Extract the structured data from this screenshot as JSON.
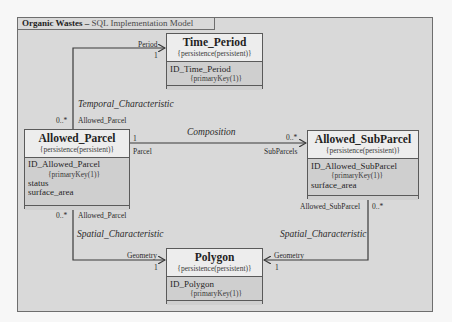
{
  "frame": {
    "title_bold": "Organic Wastes – ",
    "title_rest": "SQL Implementation Model"
  },
  "classes": {
    "time_period": {
      "name": "Time_Period",
      "stereotype": "{persistence(persistent)}",
      "attributes": [
        {
          "name": "ID_Time_Period",
          "constraint": "{primaryKey(1)}"
        }
      ]
    },
    "allowed_parcel": {
      "name": "Allowed_Parcel",
      "stereotype": "{persistence(persistent)}",
      "attributes": [
        {
          "name": "ID_Allowed_Parcel",
          "constraint": "{primaryKey(1)}"
        },
        {
          "name": "status"
        },
        {
          "name": "surface_area"
        }
      ]
    },
    "allowed_subparcel": {
      "name": "Allowed_SubParcel",
      "stereotype": "{persistence(persistent)}",
      "attributes": [
        {
          "name": "ID_Allowed_SubParcel",
          "constraint": "{primaryKey(1)}"
        },
        {
          "name": "surface_area"
        }
      ]
    },
    "polygon": {
      "name": "Polygon",
      "stereotype": "{persistence(persistent)}",
      "attributes": [
        {
          "name": "ID_Polygon",
          "constraint": "{primaryKey(1)}"
        }
      ]
    }
  },
  "associations": {
    "temporal": {
      "name": "Temporal_Characteristic",
      "source_role": "Allowed_Parcel",
      "source_mult": "0..*",
      "target_role": "Period",
      "target_mult": "1"
    },
    "composition": {
      "name": "Composition",
      "source_role": "Parcel",
      "source_mult": "1",
      "target_role": "SubParcels",
      "target_mult": "0..*"
    },
    "spatial_parcel": {
      "name": "Spatial_Characteristic",
      "source_role": "Allowed_Parcel",
      "source_mult": "0..*",
      "target_role": "Geometry",
      "target_mult": "1"
    },
    "spatial_subparcel": {
      "name": "Spatial_Characteristic",
      "source_role": "Allowed_SubParcel",
      "source_mult": "0..*",
      "target_role": "Geometry",
      "target_mult": "1"
    }
  }
}
